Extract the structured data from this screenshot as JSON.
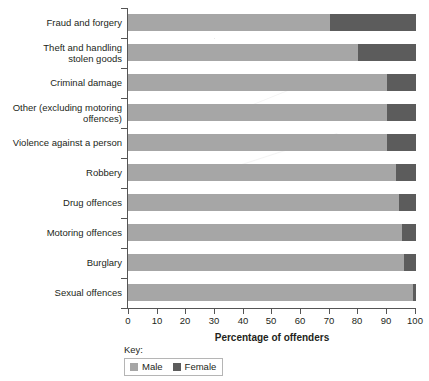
{
  "chart_data": {
    "type": "bar",
    "orientation": "horizontal",
    "stacked": true,
    "title": "",
    "xlabel": "Percentage of offenders",
    "ylabel": "",
    "xlim": [
      0,
      100
    ],
    "xticks": [
      0,
      10,
      20,
      30,
      40,
      50,
      60,
      70,
      80,
      90,
      100
    ],
    "xtick_labels": [
      "0",
      "10",
      "20",
      "30",
      "40",
      "50",
      "60",
      "70",
      "80",
      "90",
      "100"
    ],
    "grid": false,
    "legend_position": "bottom-left",
    "legend_title": "Key:",
    "categories": [
      "Fraud and forgery",
      "Theft and handling\nstolen goods",
      "Criminal damage",
      "Other (excluding motoring\noffences)",
      "Violence against a person",
      "Robbery",
      "Drug offences",
      "Motoring offences",
      "Burglary",
      "Sexual offences"
    ],
    "series": [
      {
        "name": "Male",
        "color": "#a6a6a6",
        "values": [
          70,
          80,
          90,
          90,
          90,
          93,
          94,
          95,
          96,
          99
        ]
      },
      {
        "name": "Female",
        "color": "#5c5c5c",
        "values": [
          30,
          20,
          10,
          10,
          10,
          7,
          6,
          5,
          4,
          1
        ]
      }
    ]
  },
  "axis": {
    "x_title": "Percentage of offenders"
  },
  "key": {
    "label": "Key:",
    "entries": [
      {
        "label": "Male",
        "color": "#a6a6a6",
        "icon": "square-swatch-icon"
      },
      {
        "label": "Female",
        "color": "#5c5c5c",
        "icon": "square-swatch-icon"
      }
    ]
  }
}
